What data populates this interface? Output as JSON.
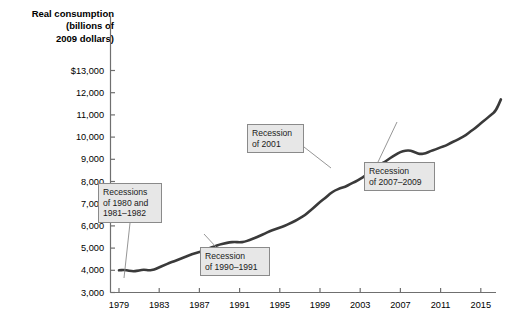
{
  "chart_data": {
    "type": "line",
    "title": "Real consumption\n(billions of\n2009 dollars)",
    "xlabel": "",
    "ylabel": "Real consumption (billions of 2009 dollars)",
    "grid": false,
    "legend": "none",
    "xlim": [
      1979,
      2017
    ],
    "ylim": [
      3000,
      13000
    ],
    "ytick_labels": [
      "$13,000",
      "12,000",
      "11,000",
      "10,000",
      "9,000",
      "8,000",
      "7,000",
      "6,000",
      "5,000",
      "4,000",
      "3,000"
    ],
    "ytick_values": [
      13000,
      12000,
      11000,
      10000,
      9000,
      8000,
      7000,
      6000,
      5000,
      4000,
      3000
    ],
    "xtick_labels": [
      "1979",
      "1983",
      "1987",
      "1991",
      "1995",
      "1999",
      "2003",
      "2007",
      "2011",
      "2015"
    ],
    "xtick_values": [
      1979,
      1983,
      1987,
      1991,
      1995,
      1999,
      2003,
      2007,
      2011,
      2015
    ],
    "series": [
      {
        "name": "Real consumption",
        "color": "#3a3a3a",
        "x": [
          1979,
          1979.5,
          1980,
          1980.5,
          1981,
          1981.5,
          1982,
          1982.5,
          1983,
          1983.5,
          1984,
          1984.5,
          1985,
          1985.5,
          1986,
          1986.5,
          1987,
          1987.5,
          1988,
          1988.5,
          1989,
          1989.5,
          1990,
          1990.5,
          1991,
          1991.5,
          1992,
          1992.5,
          1993,
          1993.5,
          1994,
          1994.5,
          1995,
          1995.5,
          1996,
          1996.5,
          1997,
          1997.5,
          1998,
          1998.5,
          1999,
          1999.5,
          2000,
          2000.5,
          2001,
          2001.5,
          2002,
          2002.5,
          2003,
          2003.5,
          2004,
          2004.5,
          2005,
          2005.5,
          2006,
          2006.5,
          2007,
          2007.5,
          2008,
          2008.5,
          2009,
          2009.5,
          2010,
          2010.5,
          2011,
          2011.5,
          2012,
          2012.5,
          2013,
          2013.5,
          2014,
          2014.5,
          2015,
          2015.5,
          2016,
          2016.5
        ],
        "y": [
          4000,
          4020,
          3980,
          3950,
          4000,
          4030,
          3990,
          4030,
          4130,
          4230,
          4330,
          4410,
          4500,
          4590,
          4680,
          4760,
          4830,
          4890,
          4990,
          5080,
          5160,
          5210,
          5260,
          5280,
          5260,
          5280,
          5370,
          5450,
          5550,
          5650,
          5760,
          5840,
          5920,
          6000,
          6110,
          6220,
          6350,
          6480,
          6680,
          6870,
          7080,
          7250,
          7450,
          7600,
          7690,
          7760,
          7880,
          7990,
          8120,
          8260,
          8440,
          8600,
          8770,
          8900,
          9060,
          9200,
          9330,
          9390,
          9400,
          9300,
          9230,
          9270,
          9370,
          9440,
          9540,
          9610,
          9740,
          9840,
          9960,
          10080,
          10260,
          10420,
          10620,
          10800,
          11000,
          11180
        ],
        "final_value": 11700
      }
    ],
    "annotations": [
      {
        "id": "recessions-1980-1982",
        "text": "Recessions\nof 1980 and\n1981–1982",
        "box": {
          "x": 98,
          "y": 183,
          "w": 64,
          "h": 40
        },
        "leader": {
          "x1": 130,
          "y1": 223,
          "x2": 124,
          "y2": 278
        }
      },
      {
        "id": "recession-1990-1991",
        "text": "Recession\nof 1990–1991",
        "box": {
          "x": 200,
          "y": 247,
          "w": 70,
          "h": 29
        },
        "leader": {
          "x1": 216,
          "y1": 247,
          "x2": 204,
          "y2": 234
        }
      },
      {
        "id": "recession-2001",
        "text": "Recession\nof 2001",
        "box": {
          "x": 247,
          "y": 124,
          "w": 57,
          "h": 29
        },
        "leader": {
          "x1": 304,
          "y1": 147,
          "x2": 331,
          "y2": 168
        }
      },
      {
        "id": "recession-2007-2009",
        "text": "Recession\nof 2007–2009",
        "box": {
          "x": 364,
          "y": 162,
          "w": 71,
          "h": 29
        },
        "leader": {
          "x1": 378,
          "y1": 162,
          "x2": 397,
          "y2": 122
        }
      }
    ]
  },
  "colors": {
    "line": "#3a3a3a",
    "axis": "#6f6f6f",
    "callout_fill": "#e7e7e7",
    "callout_border": "#8a8a8a",
    "leader": "#8a8a8a",
    "text": "#000000"
  }
}
